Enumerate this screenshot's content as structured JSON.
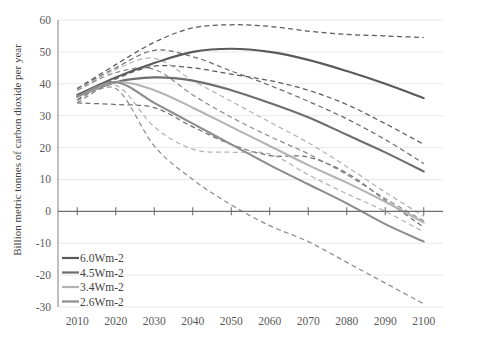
{
  "chart_data": {
    "type": "line",
    "title": "",
    "xlabel": "",
    "ylabel": "Billion metric tonnes of carbon dioxide per year",
    "x": [
      2010,
      2020,
      2030,
      2040,
      2050,
      2060,
      2070,
      2080,
      2090,
      2100
    ],
    "xlim": [
      2005,
      2105
    ],
    "ylim": [
      -30,
      60
    ],
    "xticks": [
      "2010",
      "2020",
      "2030",
      "2040",
      "2050",
      "2060",
      "2070",
      "2080",
      "2090",
      "2100"
    ],
    "yticks": [
      "60",
      "50",
      "40",
      "30",
      "20",
      "10",
      "0",
      "-10",
      "-20",
      "-30"
    ],
    "grid": true,
    "legend_position": "bottom-left",
    "legend": [
      "6.0Wm-2",
      "4.5Wm-2",
      "3.4Wm-2",
      "2.6Wm-2"
    ],
    "colors": {
      "6.0Wm-2": "#5a5a5a",
      "4.5Wm-2": "#6e6e6e",
      "3.4Wm-2": "#b4b4b4",
      "2.6Wm-2": "#8d8d8d"
    },
    "series": [
      {
        "name": "6.0Wm-2",
        "style": "solid",
        "color": "#5a5a5a",
        "values": [
          36.5,
          42.0,
          46.5,
          50.0,
          51.0,
          50.0,
          47.5,
          44.0,
          40.0,
          35.5
        ]
      },
      {
        "name": "4.5Wm-2",
        "style": "solid",
        "color": "#6e6e6e",
        "values": [
          36.0,
          40.5,
          42.0,
          41.0,
          38.0,
          34.0,
          29.5,
          24.0,
          18.5,
          12.5
        ]
      },
      {
        "name": "3.4Wm-2",
        "style": "solid",
        "color": "#b4b4b4",
        "values": [
          36.0,
          40.5,
          38.0,
          32.5,
          26.5,
          20.5,
          14.5,
          9.0,
          3.0,
          -3.5
        ]
      },
      {
        "name": "2.6Wm-2",
        "style": "solid",
        "color": "#8d8d8d",
        "values": [
          36.0,
          40.5,
          34.0,
          27.5,
          21.0,
          14.5,
          8.5,
          2.5,
          -4.0,
          -9.5
        ]
      },
      {
        "name": "6.0Wm-2 range high",
        "style": "dashed",
        "color": "#5a5a5a",
        "values": [
          38.5,
          46.0,
          53.0,
          57.5,
          58.5,
          58.0,
          56.5,
          55.5,
          55.0,
          54.5
        ]
      },
      {
        "name": "6.0Wm-2 range low",
        "style": "dashed",
        "color": "#5a5a5a",
        "values": [
          35.0,
          41.5,
          45.5,
          45.0,
          43.0,
          41.0,
          38.0,
          33.5,
          27.5,
          21.0
        ]
      },
      {
        "name": "4.5Wm-2 range high",
        "style": "dashed",
        "color": "#6e6e6e",
        "values": [
          38.5,
          45.0,
          50.5,
          48.5,
          44.0,
          39.5,
          34.5,
          29.0,
          22.5,
          15.0
        ]
      },
      {
        "name": "4.5Wm-2 range low",
        "style": "dashed",
        "color": "#6e6e6e",
        "values": [
          34.0,
          33.5,
          32.5,
          26.5,
          21.0,
          17.5,
          17.0,
          12.0,
          3.5,
          -5.0
        ]
      },
      {
        "name": "3.4Wm-2 range high",
        "style": "dashed",
        "color": "#b4b4b4",
        "values": [
          38.0,
          44.5,
          48.0,
          41.0,
          34.5,
          28.0,
          21.5,
          14.0,
          6.0,
          -1.5
        ]
      },
      {
        "name": "3.4Wm-2 range low",
        "style": "dashed",
        "color": "#b4b4b4",
        "values": [
          34.5,
          39.5,
          26.5,
          19.5,
          18.5,
          18.0,
          11.5,
          5.5,
          0.0,
          -6.5
        ]
      },
      {
        "name": "2.6Wm-2 range high",
        "style": "dashed",
        "color": "#8d8d8d",
        "values": [
          38.0,
          43.5,
          44.5,
          36.5,
          29.5,
          23.5,
          18.0,
          11.5,
          4.0,
          -3.0
        ]
      },
      {
        "name": "2.6Wm-2 range low",
        "style": "dashed",
        "color": "#8d8d8d",
        "values": [
          34.0,
          38.5,
          20.5,
          10.0,
          2.0,
          -4.5,
          -9.5,
          -16.0,
          -22.5,
          -29.0
        ]
      }
    ]
  }
}
